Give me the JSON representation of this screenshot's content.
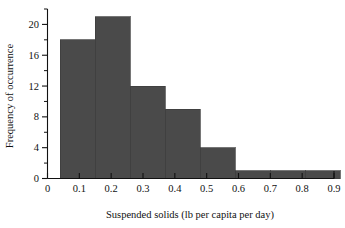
{
  "chart_data": {
    "type": "bar",
    "title": "",
    "subtitle": "",
    "xlabel": "Suspended solids (lb per capita per day)",
    "ylabel": "Frequency of occurrence",
    "xlim": [
      0,
      0.9
    ],
    "ylim": [
      0,
      22
    ],
    "grid": false,
    "legend": null,
    "bar_color": "#4a4a4a",
    "bar_edge_color": "#3c3c3c",
    "axis_color": "#111111",
    "background": "#ffffff",
    "bin_edges": [
      0.04,
      0.15,
      0.26,
      0.37,
      0.48,
      0.59,
      0.7,
      0.81,
      0.92
    ],
    "bin_labels": [
      "0.04-0.15",
      "0.15-0.26",
      "0.26-0.37",
      "0.37-0.48",
      "0.48-0.59",
      "0.59-0.70",
      "0.70-0.81",
      "0.81-0.92"
    ],
    "categories": [
      "0.04-0.15",
      "0.15-0.26",
      "0.26-0.37",
      "0.37-0.48",
      "0.48-0.59",
      "0.59-0.70",
      "0.70-0.81",
      "0.81-0.92"
    ],
    "values": [
      18,
      21,
      12,
      9,
      4,
      1,
      1,
      1
    ],
    "bars": [
      {
        "x0": 0.04,
        "x1": 0.15,
        "value": 18
      },
      {
        "x0": 0.15,
        "x1": 0.26,
        "value": 21
      },
      {
        "x0": 0.26,
        "x1": 0.37,
        "value": 12
      },
      {
        "x0": 0.37,
        "x1": 0.48,
        "value": 9
      },
      {
        "x0": 0.48,
        "x1": 0.59,
        "value": 4
      },
      {
        "x0": 0.59,
        "x1": 0.7,
        "value": 1
      },
      {
        "x0": 0.7,
        "x1": 0.81,
        "value": 1
      },
      {
        "x0": 0.81,
        "x1": 0.92,
        "value": 1
      }
    ],
    "x_ticks": [
      0,
      0.1,
      0.2,
      0.3,
      0.4,
      0.5,
      0.6,
      0.7,
      0.8,
      0.9
    ],
    "x_tick_labels": [
      "0",
      "0.1",
      "0.2",
      "0.3",
      "0.4",
      "0.5",
      "0.6",
      "0.7",
      "0.8",
      "0.9"
    ],
    "y_ticks": [
      0,
      4,
      8,
      12,
      16,
      20
    ],
    "y_tick_labels": [
      "0",
      "4",
      "8",
      "12",
      "16",
      "20"
    ],
    "y_minor_ticks": [
      2,
      6,
      10,
      14,
      18,
      22
    ]
  },
  "axes": {
    "x_label": "Suspended solids (lb per capita per day)",
    "y_label": "Frequency of occurrence",
    "x_tick_labels": [
      "0",
      "0.1",
      "0.2",
      "0.3",
      "0.4",
      "0.5",
      "0.6",
      "0.7",
      "0.8",
      "0.9"
    ],
    "y_tick_labels": [
      "0",
      "4",
      "8",
      "12",
      "16",
      "20"
    ]
  }
}
